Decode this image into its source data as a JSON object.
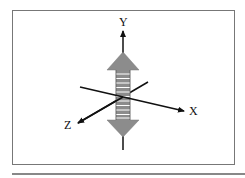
{
  "diagram": {
    "title": "",
    "axes": [
      {
        "name": "y-axis",
        "label": "Y"
      },
      {
        "name": "x-axis",
        "label": "X"
      },
      {
        "name": "z-axis",
        "label": "Z"
      }
    ],
    "element": {
      "name": "double-headed-coil-arrow",
      "orientation": "along Y axis",
      "color": "#8c8c8c",
      "coil_turns": 11
    },
    "colors": {
      "axis": "#111111",
      "frame": "#777777",
      "arrow_fill": "#8c8c8c",
      "coil_stripe": "#ffffff"
    }
  }
}
